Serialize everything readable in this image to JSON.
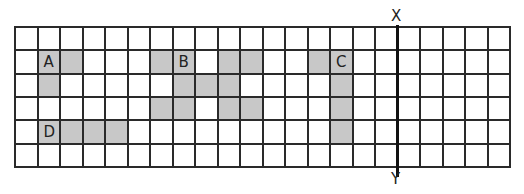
{
  "diagram": {
    "grid": {
      "columns": 22,
      "rows": 6
    },
    "axis": {
      "top_label": "X",
      "bottom_label": "Y",
      "after_column": 17
    },
    "shade_color": "#c8c8c8",
    "shapes": [
      {
        "label": "A",
        "label_cell": [
          1,
          1
        ],
        "cells": [
          [
            1,
            1
          ],
          [
            1,
            2
          ],
          [
            2,
            1
          ]
        ]
      },
      {
        "label": "B",
        "label_cell": [
          1,
          7
        ],
        "cells": [
          [
            1,
            6
          ],
          [
            1,
            7
          ],
          [
            1,
            9
          ],
          [
            1,
            10
          ],
          [
            2,
            7
          ],
          [
            2,
            8
          ],
          [
            2,
            9
          ],
          [
            3,
            6
          ],
          [
            3,
            7
          ],
          [
            3,
            9
          ],
          [
            3,
            10
          ]
        ]
      },
      {
        "label": "C",
        "label_cell": [
          1,
          14
        ],
        "cells": [
          [
            1,
            13
          ],
          [
            1,
            14
          ],
          [
            2,
            14
          ],
          [
            3,
            14
          ],
          [
            4,
            14
          ]
        ]
      },
      {
        "label": "D",
        "label_cell": [
          4,
          1
        ],
        "cells": [
          [
            4,
            1
          ],
          [
            4,
            2
          ],
          [
            4,
            3
          ],
          [
            4,
            4
          ]
        ]
      }
    ]
  }
}
